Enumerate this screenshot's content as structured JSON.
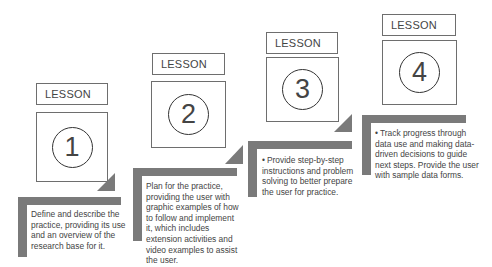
{
  "lessons": [
    {
      "label": "LESSON",
      "number": "1",
      "description": "Define and describe the practice, providing its use and an overview of the research base for it.",
      "bulleted": false
    },
    {
      "label": "LESSON",
      "number": "2",
      "description": "Plan for the practice, providing the user with graphic examples of how to follow and implement it, which includes extension activities and video examples to assist the user.",
      "bulleted": false
    },
    {
      "label": "LESSON",
      "number": "3",
      "description": "Provide step-by-step instructions and problem solving to better prepare the user for practice.",
      "bulleted": true
    },
    {
      "label": "LESSON",
      "number": "4",
      "description": "Track progress through data use and making data-driven decisions to guide next steps. Provide the user with sample data forms.",
      "bulleted": true
    }
  ],
  "colors": {
    "bar": "#7a7a7a",
    "border": "#6e6e6e",
    "text": "#444444"
  }
}
